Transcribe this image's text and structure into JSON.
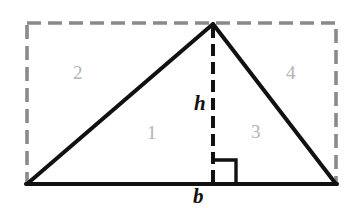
{
  "figure": {
    "background_color": "#ffffff",
    "width": 355,
    "height": 208
  },
  "colors": {
    "outline_stroke": "#111111",
    "dashed_rectangle_stroke": "#8a8a8a",
    "height_line_stroke": "#111111",
    "region_number_text": "#b4b4b4",
    "dimension_label_text": "#111111"
  },
  "shapes": {
    "bounding_rectangle": {
      "name": "dashed-bounding-rectangle",
      "style": "dashed",
      "x": 27,
      "y": 23,
      "width": 309,
      "height": 161
    },
    "triangle": {
      "name": "solid-triangle",
      "style": "solid",
      "apex": {
        "x": 213,
        "y": 24
      },
      "bottom_left": {
        "x": 27,
        "y": 184
      },
      "bottom_right": {
        "x": 336,
        "y": 184
      }
    },
    "height_segment": {
      "name": "height-altitude-dashed-segment",
      "style": "dashed",
      "x": 213,
      "y_top": 24,
      "y_bottom": 184
    },
    "right_angle_marker": {
      "name": "right-angle-square-marker",
      "x": 213,
      "y": 160,
      "size": 23
    }
  },
  "region_labels": [
    {
      "id": "region-1",
      "text": "1",
      "x": 152,
      "y": 132
    },
    {
      "id": "region-2",
      "text": "2",
      "x": 78,
      "y": 72
    },
    {
      "id": "region-3",
      "text": "3",
      "x": 256,
      "y": 131
    },
    {
      "id": "region-4",
      "text": "4",
      "x": 291,
      "y": 72
    }
  ],
  "dimension_labels": [
    {
      "id": "height-label",
      "text": "h",
      "x": 199,
      "y": 103,
      "meaning": "height"
    },
    {
      "id": "base-label",
      "text": "b",
      "x": 198,
      "y": 196,
      "meaning": "base"
    }
  ]
}
